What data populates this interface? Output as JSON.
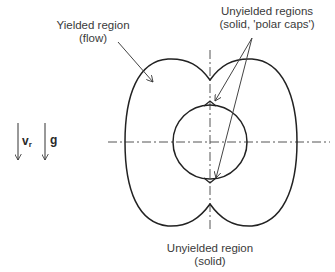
{
  "diagram": {
    "labels": {
      "yielded": {
        "line1": "Yielded region",
        "line2": "(flow)"
      },
      "unyielded_caps": {
        "line1": "Unyielded regions",
        "line2": "(solid, 'polar caps')"
      },
      "unyielded_bottom": {
        "line1": "Unyielded region",
        "line2": "(solid)"
      }
    },
    "vectors": [
      {
        "symbol": "v",
        "subscript": "r",
        "name": "relative-velocity"
      },
      {
        "symbol": "g",
        "subscript": "",
        "name": "gravity"
      }
    ],
    "colors": {
      "stroke": "#222222",
      "axis": "#555555",
      "text": "#3a3a3a"
    }
  }
}
